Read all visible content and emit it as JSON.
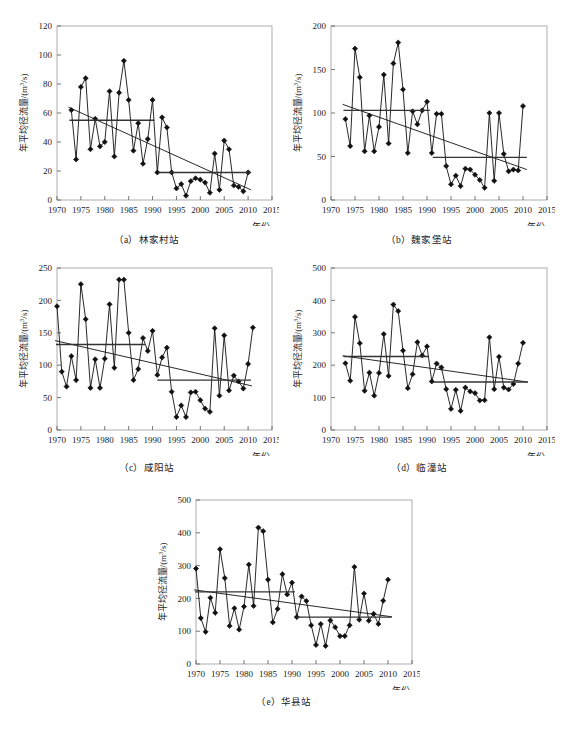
{
  "figure": {
    "axis_titles": {
      "x": "年份",
      "y": "年平均径流量/(m",
      "y_sup": "3",
      "y_tail": "/s)"
    }
  },
  "panels": [
    {
      "id": "a",
      "caption": "（a）林家村站",
      "station": "林家村站",
      "ylabel": "年平均径流量/(m3/s)",
      "xlabel": "年份"
    },
    {
      "id": "b",
      "caption": "（b）魏家堡站",
      "station": "魏家堡站",
      "ylabel": "年平均径流量/(m3/s)",
      "xlabel": "年份"
    },
    {
      "id": "c",
      "caption": "（c）咸阳站",
      "station": "咸阳站",
      "ylabel": "年平均径流量/(m3/s)",
      "xlabel": "年份"
    },
    {
      "id": "d",
      "caption": "（d）临潼站",
      "station": "临潼站",
      "ylabel": "年平均径流量/(m3/s)",
      "xlabel": "年份"
    },
    {
      "id": "e",
      "caption": "（e）华县站",
      "station": "华县站",
      "ylabel": "年平均径流量/(m3/s)",
      "xlabel": "年份"
    }
  ],
  "chart_data": [
    {
      "type": "line",
      "id": "a",
      "title": "（a）林家村站",
      "xlabel": "年份",
      "ylabel": "年平均径流量/(m3/s)",
      "xlim": [
        1970,
        2015
      ],
      "ylim": [
        0,
        120
      ],
      "xticks": [
        1970,
        1975,
        1980,
        1985,
        1990,
        1995,
        2000,
        2005,
        2010,
        2015
      ],
      "yticks": [
        0,
        20,
        40,
        60,
        80,
        100,
        120
      ],
      "grid": false,
      "legend": "none",
      "series": [
        {
          "name": "年平均径流量",
          "x": [
            1973,
            1974,
            1975,
            1976,
            1977,
            1978,
            1979,
            1980,
            1981,
            1982,
            1983,
            1984,
            1985,
            1986,
            1987,
            1988,
            1989,
            1990,
            1991,
            1992,
            1993,
            1994,
            1995,
            1996,
            1997,
            1998,
            1999,
            2000,
            2001,
            2002,
            2003,
            2004,
            2005,
            2006,
            2007,
            2008,
            2009,
            2010
          ],
          "values": [
            62,
            28,
            78,
            84,
            35,
            56,
            37,
            40,
            75,
            30,
            74,
            96,
            69,
            34,
            53,
            25,
            42,
            69,
            19,
            57,
            50,
            19,
            8,
            11,
            3,
            13,
            15,
            14,
            12,
            5,
            32,
            7,
            41,
            35,
            10,
            9,
            6,
            19
          ]
        }
      ],
      "trend_line": {
        "name": "线性趋势线",
        "x": [
          1972.4,
          2010.6
        ],
        "y": [
          64,
          7
        ]
      },
      "mean_segments": [
        {
          "name": "突变前均值",
          "x": [
            1972.6,
            1990.4
          ],
          "y": 55
        },
        {
          "name": "突变后均值",
          "x": [
            1991.2,
            2010.6
          ],
          "y": 19
        }
      ]
    },
    {
      "type": "line",
      "id": "b",
      "title": "（b）魏家堡站",
      "xlabel": "年份",
      "ylabel": "年平均径流量/(m3/s)",
      "xlim": [
        1970,
        2015
      ],
      "ylim": [
        0,
        200
      ],
      "xticks": [
        1970,
        1975,
        1980,
        1985,
        1990,
        1995,
        2000,
        2005,
        2010,
        2015
      ],
      "yticks": [
        0,
        50,
        100,
        150,
        200
      ],
      "grid": false,
      "legend": "none",
      "series": [
        {
          "name": "年平均径流量",
          "x": [
            1973,
            1974,
            1975,
            1976,
            1977,
            1978,
            1979,
            1980,
            1981,
            1982,
            1983,
            1984,
            1985,
            1986,
            1987,
            1988,
            1989,
            1990,
            1991,
            1992,
            1993,
            1994,
            1995,
            1996,
            1997,
            1998,
            1999,
            2000,
            2001,
            2002,
            2003,
            2004,
            2005,
            2006,
            2007,
            2008,
            2009,
            2010
          ],
          "values": [
            93,
            62,
            174,
            141,
            56,
            97,
            56,
            84,
            144,
            65,
            157,
            181,
            127,
            54,
            102,
            87,
            103,
            113,
            54,
            99,
            99,
            39,
            18,
            28,
            16,
            36,
            35,
            29,
            23,
            14,
            100,
            22,
            100,
            53,
            33,
            35,
            34,
            108
          ]
        }
      ],
      "trend_line": {
        "name": "线性趋势线",
        "x": [
          1972.4,
          2010.8
        ],
        "y": [
          110,
          35
        ]
      },
      "mean_segments": [
        {
          "name": "突变前均值",
          "x": [
            1972.6,
            1990.6
          ],
          "y": 103
        },
        {
          "name": "突变后均值",
          "x": [
            1991.2,
            2010.8
          ],
          "y": 49
        }
      ]
    },
    {
      "type": "line",
      "id": "c",
      "title": "（c）咸阳站",
      "xlabel": "年份",
      "ylabel": "年平均径流量/(m3/s)",
      "xlim": [
        1970,
        2015
      ],
      "ylim": [
        0,
        250
      ],
      "xticks": [
        1970,
        1975,
        1980,
        1985,
        1990,
        1995,
        2000,
        2005,
        2010,
        2015
      ],
      "yticks": [
        0,
        50,
        100,
        150,
        200,
        250
      ],
      "grid": false,
      "legend": "none",
      "series": [
        {
          "name": "年平均径流量",
          "x": [
            1970,
            1971,
            1972,
            1973,
            1974,
            1975,
            1976,
            1977,
            1978,
            1979,
            1980,
            1981,
            1982,
            1983,
            1984,
            1985,
            1986,
            1987,
            1988,
            1989,
            1990,
            1991,
            1992,
            1993,
            1994,
            1995,
            1996,
            1997,
            1998,
            1999,
            2000,
            2001,
            2002,
            2003,
            2004,
            2005,
            2006,
            2007,
            2008,
            2009,
            2010,
            2011
          ],
          "values": [
            191,
            90,
            67,
            114,
            77,
            225,
            171,
            65,
            109,
            65,
            110,
            194,
            96,
            232,
            232,
            150,
            77,
            94,
            142,
            122,
            153,
            85,
            112,
            127,
            59,
            20,
            38,
            20,
            58,
            59,
            46,
            33,
            28,
            157,
            53,
            146,
            61,
            84,
            75,
            64,
            102,
            158
          ]
        }
      ],
      "trend_line": {
        "name": "线性趋势线",
        "x": [
          1969.6,
          2010.8
        ],
        "y": [
          138,
          68
        ]
      },
      "mean_segments": [
        {
          "name": "突变前均值",
          "x": [
            1969.8,
            1988.4
          ],
          "y": 132
        },
        {
          "name": "突变后均值",
          "x": [
            1991.0,
            2010.6
          ],
          "y": 77
        }
      ]
    },
    {
      "type": "line",
      "id": "d",
      "title": "（d）临潼站",
      "xlabel": "年份",
      "ylabel": "年平均径流量/(m3/s)",
      "xlim": [
        1970,
        2015
      ],
      "ylim": [
        0,
        500
      ],
      "xticks": [
        1970,
        1975,
        1980,
        1985,
        1990,
        1995,
        2000,
        2005,
        2010,
        2015
      ],
      "yticks": [
        0,
        100,
        200,
        300,
        400,
        500
      ],
      "grid": false,
      "legend": "none",
      "series": [
        {
          "name": "年平均径流量",
          "x": [
            1973,
            1974,
            1975,
            1976,
            1977,
            1978,
            1979,
            1980,
            1981,
            1982,
            1983,
            1984,
            1985,
            1986,
            1987,
            1988,
            1989,
            1990,
            1991,
            1992,
            1993,
            1994,
            1995,
            1996,
            1997,
            1998,
            1999,
            2000,
            2001,
            2002,
            2003,
            2004,
            2005,
            2006,
            2007,
            2008,
            2009,
            2010
          ],
          "values": [
            206,
            152,
            349,
            268,
            121,
            177,
            106,
            176,
            296,
            167,
            387,
            367,
            245,
            129,
            172,
            271,
            230,
            258,
            150,
            205,
            193,
            126,
            65,
            124,
            59,
            131,
            119,
            114,
            91,
            92,
            286,
            126,
            226,
            131,
            125,
            142,
            205,
            269
          ]
        }
      ],
      "trend_line": {
        "name": "线性趋势线",
        "x": [
          1972.4,
          2011.0
        ],
        "y": [
          229,
          148
        ]
      },
      "mean_segments": [
        {
          "name": "突变前均值",
          "x": [
            1972.6,
            1990.4
          ],
          "y": 227
        },
        {
          "name": "突变后均值",
          "x": [
            1991.2,
            2011.0
          ],
          "y": 148
        }
      ]
    },
    {
      "type": "line",
      "id": "e",
      "title": "（e）华县站",
      "xlabel": "年份",
      "ylabel": "年平均径流量/(m3/s)",
      "xlim": [
        1970,
        2015
      ],
      "ylim": [
        0,
        500
      ],
      "xticks": [
        1970,
        1975,
        1980,
        1985,
        1990,
        1995,
        2000,
        2005,
        2010,
        2015
      ],
      "yticks": [
        0,
        100,
        200,
        300,
        400,
        500
      ],
      "grid": false,
      "legend": "none",
      "series": [
        {
          "name": "年平均径流量",
          "x": [
            1970,
            1971,
            1972,
            1973,
            1974,
            1975,
            1976,
            1977,
            1978,
            1979,
            1980,
            1981,
            1982,
            1983,
            1984,
            1985,
            1986,
            1987,
            1988,
            1989,
            1990,
            1991,
            1992,
            1993,
            1994,
            1995,
            1996,
            1997,
            1998,
            1999,
            2000,
            2001,
            2002,
            2003,
            2004,
            2005,
            2006,
            2007,
            2008,
            2009,
            2010
          ],
          "values": [
            291,
            140,
            98,
            202,
            156,
            350,
            262,
            116,
            170,
            105,
            175,
            303,
            177,
            416,
            405,
            257,
            127,
            168,
            274,
            212,
            248,
            143,
            206,
            192,
            118,
            58,
            122,
            55,
            133,
            112,
            85,
            85,
            118,
            296,
            135,
            215,
            132,
            153,
            122,
            193,
            257
          ]
        }
      ],
      "trend_line": {
        "name": "线性趋势线",
        "x": [
          1969.6,
          2010.8
        ],
        "y": [
          226,
          144
        ]
      },
      "mean_segments": [
        {
          "name": "突变前均值",
          "x": [
            1969.8,
            1990.6
          ],
          "y": 220
        },
        {
          "name": "突变后均值",
          "x": [
            1991.0,
            2010.8
          ],
          "y": 143
        }
      ]
    }
  ]
}
